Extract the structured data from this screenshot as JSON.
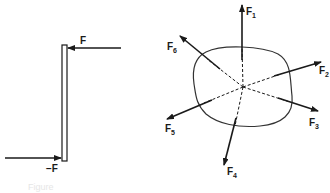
{
  "figure": {
    "left_panel": {
      "title": "Couple of forces on a rod",
      "top_force": {
        "label": "F"
      },
      "bottom_force": {
        "label": "−F"
      }
    },
    "right_panel": {
      "title": "Forces on an irregular body",
      "forces": [
        {
          "name": "F",
          "sub": "1"
        },
        {
          "name": "F",
          "sub": "2"
        },
        {
          "name": "F",
          "sub": "3"
        },
        {
          "name": "F",
          "sub": "4"
        },
        {
          "name": "F",
          "sub": "5"
        },
        {
          "name": "F",
          "sub": "6"
        }
      ]
    },
    "caption": "Figure",
    "colors": {
      "ink": "#1a1a1a",
      "outline": "#333333",
      "background": "#ffffff"
    }
  }
}
